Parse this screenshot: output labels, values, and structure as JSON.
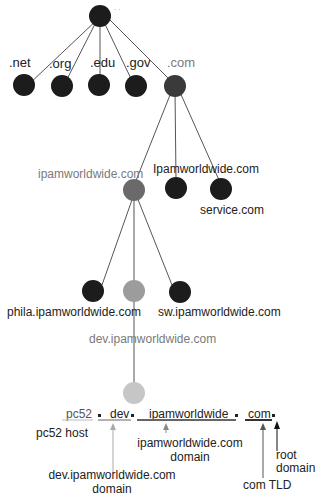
{
  "diagram": {
    "colors": {
      "dark_node": "#1c1c1c",
      "mid_node": "#6a6a6a",
      "light_node": "#9c9c9c",
      "faint_node": "#c6c6c6",
      "edge": "#555555",
      "label": "#222222",
      "gray_label": "#7a7a7a"
    },
    "tld_labels": {
      "net": ".net",
      "org": ".org",
      "edu": ".edu",
      "gov": ".gov",
      "com": ".com"
    },
    "com_children": {
      "ipam": "ipamworldwide.com",
      "ipam_alt": "Ipamworldwide.com",
      "service": "service.com"
    },
    "ipam_children": {
      "phila": "phila.ipamworldwide.com",
      "sw": "sw.ipamworldwide.com",
      "dev": "dev.ipamworldwide.com"
    },
    "fqdn": {
      "host": "pc52",
      "dot1": ".",
      "dev": "dev",
      "dot2": ".",
      "domain": "ipamworldwide",
      "dot3": ".",
      "tld": "com",
      "dot4": "."
    },
    "annotations": {
      "host": "pc52 host",
      "dev_line1": "dev.ipamworldwide.com",
      "dev_line2": "domain",
      "ipam_line1": "ipamworldwide.com",
      "ipam_line2": "domain",
      "tld": "com TLD",
      "root_line1": "root",
      "root_line2": "domain"
    }
  }
}
